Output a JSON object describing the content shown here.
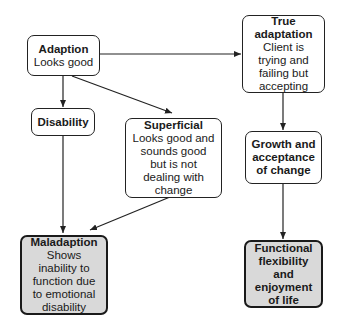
{
  "diagram": {
    "nodes": {
      "adaption": {
        "title": "Adaption",
        "desc": "Looks good"
      },
      "disability": {
        "title": "Disability"
      },
      "superficial": {
        "title": "Superficial",
        "desc": "Looks good and sounds good but is not dealing with change"
      },
      "true_adaptation": {
        "title": "True adaptation",
        "desc": "Client is trying and failing but accepting"
      },
      "growth": {
        "title": "Growth and acceptance of change"
      },
      "maladaption": {
        "title": "Maladaption",
        "desc": "Shows inability to function due to emotional disability"
      },
      "functional": {
        "title": "Functional flexibility and enjoyment of life"
      }
    },
    "edges": [
      {
        "from": "Adaption",
        "to": "True adaptation"
      },
      {
        "from": "Adaption",
        "to": "Disability"
      },
      {
        "from": "Adaption",
        "to": "Superficial"
      },
      {
        "from": "Disability",
        "to": "Maladaption"
      },
      {
        "from": "Superficial",
        "to": "Maladaption"
      },
      {
        "from": "True adaptation",
        "to": "Growth and acceptance of change"
      },
      {
        "from": "Growth and acceptance of change",
        "to": "Functional flexibility and enjoyment of life"
      }
    ],
    "colors": {
      "outcome_fill": "#d9d9d9",
      "node_fill": "#ffffff",
      "stroke": "#222222"
    }
  }
}
